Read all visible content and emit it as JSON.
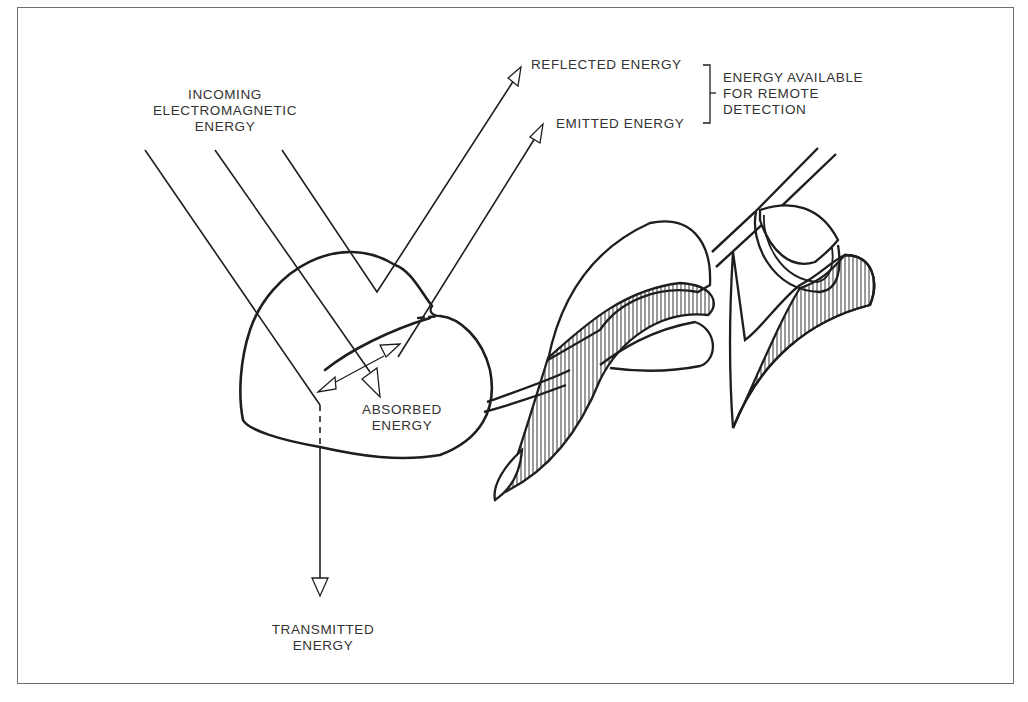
{
  "figure": {
    "labels": {
      "incoming": [
        "INCOMING",
        "ELECTROMAGNETIC",
        "ENERGY"
      ],
      "reflected": "REFLECTED ENERGY",
      "emitted": "EMITTED ENERGY",
      "available": [
        "ENERGY AVAILABLE",
        "FOR REMOTE",
        "DETECTION"
      ],
      "absorbed": [
        "ABSORBED",
        "ENERGY"
      ],
      "transmitted": [
        "TRANSMITTED",
        "ENERGY"
      ]
    },
    "colors": {
      "ink": "#1e1e1e",
      "frame": "#6f6f6f",
      "background": "#ffffff"
    }
  }
}
